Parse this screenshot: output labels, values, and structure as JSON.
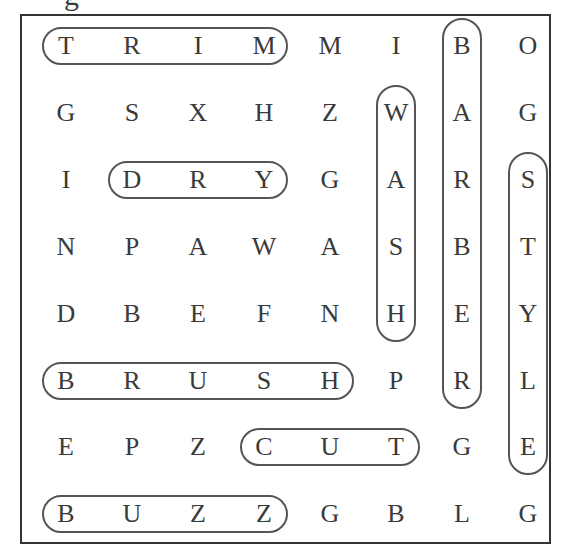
{
  "title_fragment": "g",
  "grid": {
    "rows": 8,
    "cols": 8,
    "letters": [
      [
        "T",
        "R",
        "I",
        "M",
        "M",
        "I",
        "B",
        "O"
      ],
      [
        "G",
        "S",
        "X",
        "H",
        "Z",
        "W",
        "A",
        "G"
      ],
      [
        "I",
        "D",
        "R",
        "Y",
        "G",
        "A",
        "R",
        "S"
      ],
      [
        "N",
        "P",
        "A",
        "W",
        "A",
        "S",
        "B",
        "T"
      ],
      [
        "D",
        "B",
        "E",
        "F",
        "N",
        "H",
        "E",
        "Y"
      ],
      [
        "B",
        "R",
        "U",
        "S",
        "H",
        "P",
        "R",
        "L"
      ],
      [
        "E",
        "P",
        "Z",
        "C",
        "U",
        "T",
        "G",
        "E"
      ],
      [
        "B",
        "U",
        "Z",
        "Z",
        "G",
        "B",
        "L",
        "G"
      ]
    ]
  },
  "found_words": [
    {
      "word": "TRIM",
      "direction": "horizontal",
      "row": 0,
      "col_start": 0,
      "col_end": 3
    },
    {
      "word": "DRY",
      "direction": "horizontal",
      "row": 2,
      "col_start": 1,
      "col_end": 3
    },
    {
      "word": "BRUSH",
      "direction": "horizontal",
      "row": 5,
      "col_start": 0,
      "col_end": 4
    },
    {
      "word": "CUT",
      "direction": "horizontal",
      "row": 6,
      "col_start": 3,
      "col_end": 5
    },
    {
      "word": "BUZZ",
      "direction": "horizontal",
      "row": 7,
      "col_start": 0,
      "col_end": 3
    },
    {
      "word": "WASH",
      "direction": "vertical",
      "col": 5,
      "row_start": 1,
      "row_end": 4
    },
    {
      "word": "BARBER",
      "direction": "vertical",
      "col": 6,
      "row_start": 0,
      "row_end": 5
    },
    {
      "word": "STYLE",
      "direction": "vertical",
      "col": 7,
      "row_start": 2,
      "row_end": 6
    }
  ]
}
